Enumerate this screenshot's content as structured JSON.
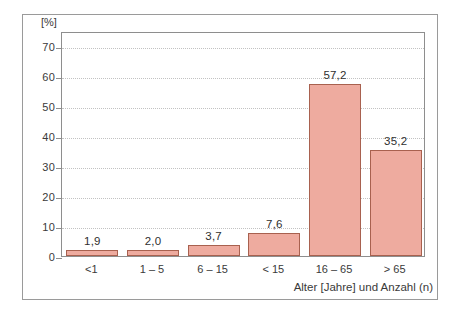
{
  "chart_data": {
    "type": "bar",
    "title": "",
    "subtitle": "",
    "categories": [
      "<1",
      "1 – 5",
      "6 – 15",
      "< 15",
      "16 – 65",
      "> 65"
    ],
    "values": [
      1.9,
      2.0,
      3.7,
      7.6,
      57.2,
      35.2
    ],
    "value_labels": [
      "1,9",
      "2,0",
      "3,7",
      "7,6",
      "57,2",
      "35,2"
    ],
    "xlabel": "Alter [Jahre] und Anzahl (n)",
    "ylabel": "[%]",
    "ylim": [
      0,
      75
    ],
    "yticks": [
      0,
      10,
      20,
      30,
      40,
      50,
      60,
      70
    ],
    "ytick_labels": [
      "0",
      "10",
      "20",
      "30",
      "40",
      "50",
      "60",
      "70"
    ],
    "grid": "horizontal-dotted",
    "legend": "none",
    "bar_fill_color": "#eeab9f",
    "bar_edge_color": "#a8614f",
    "axis_color": "#8e8e8e",
    "grid_color": "#c2c2c2",
    "text_color": "#3a3a3a",
    "frame_color": "#9a9a9a",
    "background_color": "#ffffff"
  }
}
